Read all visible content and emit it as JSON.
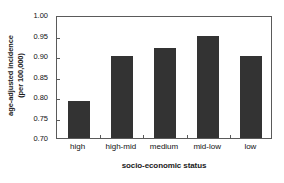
{
  "chart_data": {
    "type": "bar",
    "title": "",
    "categories": [
      "high",
      "high-mid",
      "medium",
      "mid-low",
      "low"
    ],
    "values": [
      0.79,
      0.9,
      0.92,
      0.95,
      0.9
    ],
    "xlabel": "socio-economic status",
    "ylabel": "age-adjusted incidence (per 100,000)",
    "ylabel_line1": "age-adjusted incidence",
    "ylabel_line2": "(per 100,000)",
    "ylim": [
      0.7,
      1.0
    ],
    "yticks": [
      "0.70",
      "0.75",
      "0.80",
      "0.85",
      "0.90",
      "0.95",
      "1.00"
    ],
    "ytick_values": [
      0.7,
      0.75,
      0.8,
      0.85,
      0.9,
      0.95,
      1.0
    ],
    "grid": false,
    "legend": false,
    "bar_color": "#333333",
    "axis_color": "#5a5a5a",
    "background": "#ffffff"
  }
}
